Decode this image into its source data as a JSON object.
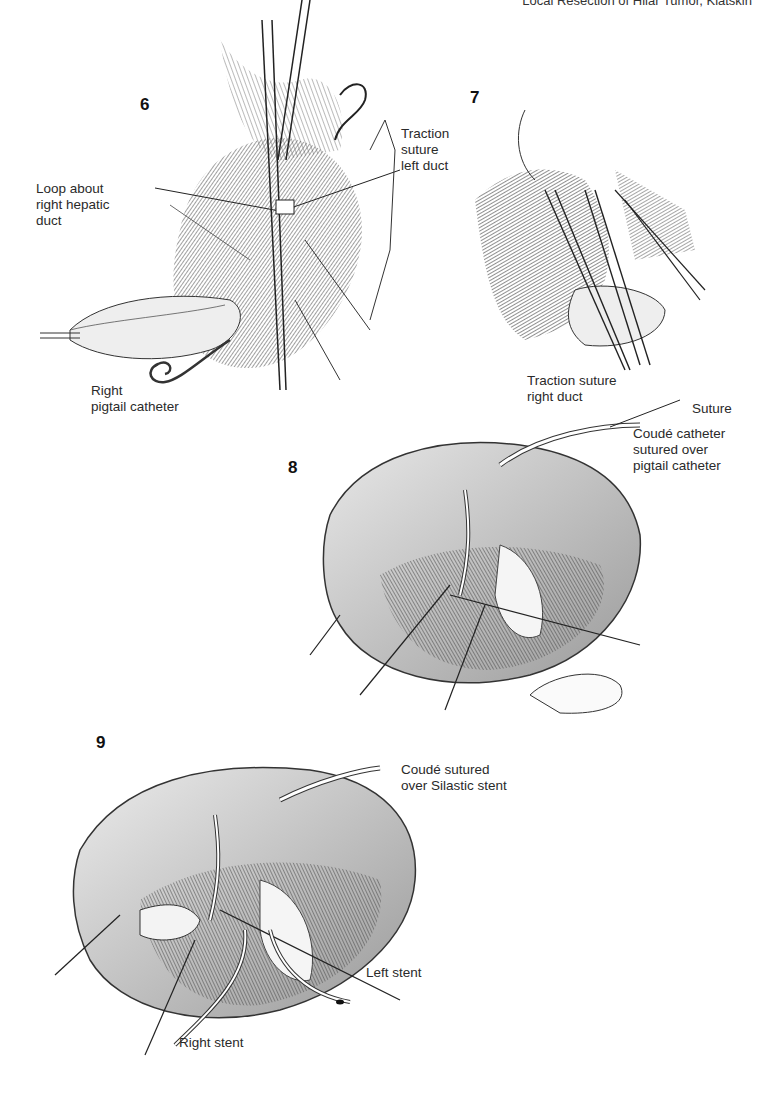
{
  "header": {
    "running_title": "Local Resection of Hilar Tumor, Klatskin",
    "page_number": ""
  },
  "figures": [
    {
      "number": "6",
      "labels": [
        {
          "text": "Loop about\nright hepatic\nduct"
        },
        {
          "text": "Traction\nsuture\nleft duct"
        },
        {
          "text": "Right\npigtail catheter"
        }
      ]
    },
    {
      "number": "7",
      "labels": [
        {
          "text": "Traction suture\nright duct"
        }
      ]
    },
    {
      "number": "8",
      "labels": [
        {
          "text": "Suture"
        },
        {
          "text": "Coudé catheter\nsutured over\npigtail catheter"
        }
      ]
    },
    {
      "number": "9",
      "labels": [
        {
          "text": "Coudé sutured\nover Silastic stent"
        },
        {
          "text": "Left stent"
        },
        {
          "text": "Right stent"
        }
      ]
    }
  ],
  "colors": {
    "ink": "#222222",
    "tissue_dark": "#555555",
    "tissue_mid": "#9a9a9a",
    "tissue_light": "#d8d8d8",
    "background": "#ffffff"
  }
}
